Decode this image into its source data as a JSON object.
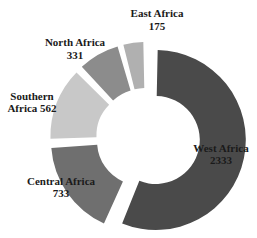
{
  "chart_data": {
    "type": "pie",
    "variant": "donut",
    "title": "",
    "categories": [
      "West Africa",
      "Central Africa",
      "Southern Africa",
      "North Africa",
      "East Africa"
    ],
    "values": [
      2333,
      733,
      562,
      331,
      175
    ],
    "colors": [
      "#4a4a4a",
      "#6f6f6f",
      "#c8c8c8",
      "#8c8c8c",
      "#b0b0b0"
    ],
    "labels": [
      {
        "line1": "West Africa",
        "line2": "2333"
      },
      {
        "line1": "Central Africa",
        "line2": "733"
      },
      {
        "line1": "Southern",
        "line2": "Africa 562"
      },
      {
        "line1": "North Africa",
        "line2": "331"
      },
      {
        "line1": "East Africa",
        "line2": "175"
      }
    ],
    "exploded": "all slices slightly separated",
    "legend": "none",
    "grid": false
  }
}
